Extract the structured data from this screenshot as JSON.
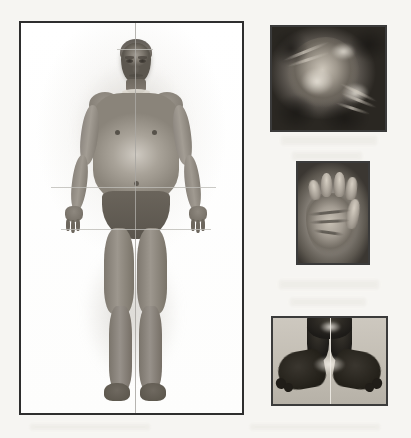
{
  "plate": {
    "kind": "clinical-photographic-plate",
    "medium": "black-and-white halftone print",
    "panel_count": 4,
    "page_background": "#f6f5f2",
    "frame_border_color": "#3a3a3a",
    "caption": "",
    "has_caption_text": false,
    "has_legible_labels": false
  },
  "panels": {
    "body": {
      "name": "full-body-frontal-view",
      "position": "left",
      "description": "Full-length frontal clinical photograph of a standing adult subject in briefs, arms abducted at the sides, shown against a plain light background with a soft photographic halo.",
      "findings": "Short limbs relative to trunk, broad thickset torso, prominent abdomen, short broad hands and short lower limbs consistent with a skeletal dysplasia.",
      "attire": "dark briefs",
      "reference_lines": "thin vertical midline and horizontal cross lines drawn over the photograph for anthropometric measurement",
      "frame": {
        "x": 19,
        "y": 21,
        "width": 225,
        "height": 394
      }
    },
    "head": {
      "name": "head-close-up",
      "position": "top-right",
      "description": "Dark close-up photograph of the subject's head and face in an oblique / lateral orientation.",
      "findings": "Coarse facial features with strong shadow modelling; low-key exposure.",
      "frame": {
        "x": 270,
        "y": 25,
        "width": 117,
        "height": 107
      }
    },
    "hand": {
      "name": "hand-palmar-view",
      "position": "middle-right",
      "description": "Close-up of the palmar surface of one hand held open toward the camera.",
      "findings": "Short, broad, stubby digits with a wide palm and deep palmar creases — brachydactyly.",
      "frame": {
        "x": 296,
        "y": 161,
        "width": 74,
        "height": 104
      }
    },
    "feet": {
      "name": "both-feet-view",
      "position": "bottom-right",
      "description": "Both lower legs and feet photographed together against a light gridded background, with a vertical reference line between them.",
      "findings": "Short broad feet with short toes; legs in silhouette against the pale backdrop.",
      "reference_lines": "single vertical midline between the feet",
      "frame": {
        "x": 271,
        "y": 316,
        "width": 117,
        "height": 90
      }
    }
  },
  "colors": {
    "page": "#f6f5f2",
    "frame": "#3a3a3a",
    "body_panel_bg": "#ffffff",
    "dark_tone": "#1d1b18",
    "mid_tone": "#8d877e",
    "light_tone": "#cdc6ba",
    "reference_line": "#a9a7a2"
  }
}
